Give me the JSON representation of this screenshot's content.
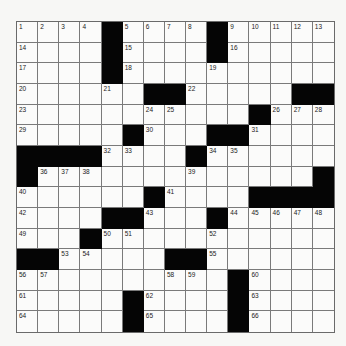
{
  "puzzle": {
    "rows": 15,
    "cols": 15,
    "grid": [
      "....#....#.....",
      "....#....#.....",
      "....#..........",
      "......##.....##",
      "...........#...",
      ".....#...##....",
      "####....#......",
      "#.............#",
      "......#....####",
      "....##...#.....",
      "...#...........",
      "##.....##......",
      "..........#....",
      ".....#....#....",
      ".....#....#...."
    ],
    "numbers": [
      [
        1,
        2,
        3,
        4,
        0,
        5,
        6,
        7,
        8,
        0,
        9,
        10,
        11,
        12,
        13
      ],
      [
        14,
        0,
        0,
        0,
        0,
        15,
        0,
        0,
        0,
        0,
        16,
        0,
        0,
        0,
        0
      ],
      [
        17,
        0,
        0,
        0,
        0,
        18,
        0,
        0,
        0,
        19,
        0,
        0,
        0,
        0,
        0
      ],
      [
        20,
        0,
        0,
        0,
        21,
        0,
        0,
        0,
        22,
        0,
        0,
        0,
        0,
        0,
        0
      ],
      [
        23,
        0,
        0,
        0,
        0,
        0,
        24,
        25,
        0,
        0,
        0,
        0,
        26,
        27,
        28
      ],
      [
        29,
        0,
        0,
        0,
        0,
        0,
        30,
        0,
        0,
        0,
        0,
        31,
        0,
        0,
        0
      ],
      [
        0,
        0,
        0,
        0,
        32,
        33,
        0,
        0,
        0,
        34,
        35,
        0,
        0,
        0,
        0
      ],
      [
        0,
        36,
        37,
        38,
        0,
        0,
        0,
        0,
        39,
        0,
        0,
        0,
        0,
        0,
        0
      ],
      [
        40,
        0,
        0,
        0,
        0,
        0,
        0,
        41,
        0,
        0,
        0,
        0,
        0,
        0,
        0
      ],
      [
        42,
        0,
        0,
        0,
        0,
        0,
        43,
        0,
        0,
        0,
        44,
        45,
        46,
        47,
        48
      ],
      [
        49,
        0,
        0,
        0,
        50,
        51,
        0,
        0,
        0,
        52,
        0,
        0,
        0,
        0,
        0
      ],
      [
        0,
        0,
        53,
        54,
        0,
        0,
        0,
        0,
        0,
        55,
        0,
        0,
        0,
        0,
        0
      ],
      [
        56,
        57,
        0,
        0,
        0,
        0,
        0,
        58,
        59,
        0,
        0,
        60,
        0,
        0,
        0
      ],
      [
        61,
        0,
        0,
        0,
        0,
        0,
        62,
        0,
        0,
        0,
        0,
        63,
        0,
        0,
        0
      ],
      [
        64,
        0,
        0,
        0,
        0,
        0,
        65,
        0,
        0,
        0,
        0,
        66,
        0,
        0,
        0
      ]
    ]
  },
  "colors": {
    "black_square": "#050505",
    "white_square": "#fbfbfa",
    "grid_line": "#7a7a7a",
    "background": "#f7f7f5"
  }
}
